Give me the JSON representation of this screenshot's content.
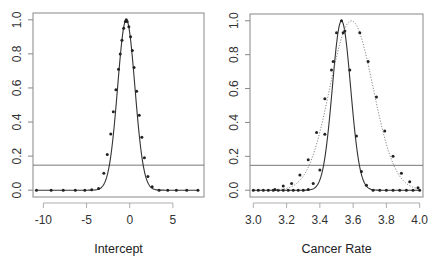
{
  "figure": {
    "top_right_text": "",
    "panels": [
      {
        "id": "intercept",
        "xlabel": "Intercept"
      },
      {
        "id": "cancer-rate",
        "xlabel": "Cancer Rate"
      }
    ]
  },
  "chart_data": [
    {
      "type": "line",
      "title": "",
      "xlabel": "Intercept",
      "ylabel": "",
      "xlim": [
        -11.2,
        8.6
      ],
      "ylim": [
        -0.04,
        1.04
      ],
      "xticks": [
        -10,
        -5,
        0,
        5
      ],
      "xtick_labels": [
        "-10",
        "-5",
        "0",
        "5"
      ],
      "yticks": [
        0.0,
        0.2,
        0.4,
        0.6,
        0.8,
        1.0
      ],
      "ytick_labels": [
        "0.0",
        "0.2",
        "0.4",
        "0.6",
        "0.8",
        "1.0"
      ],
      "grid": false,
      "legend": null,
      "hline": 0.147,
      "series": [
        {
          "name": "profile likelihood (solid, with points)",
          "style": "solid",
          "markers": true,
          "shape": "gaussian",
          "center": -0.4,
          "sd": 1.0,
          "x": [
            -10.8,
            -9.1,
            -7.7,
            -6.3,
            -5.2,
            -4.4,
            -3.6,
            -3.0,
            -2.6,
            -2.2,
            -1.9,
            -1.6,
            -1.3,
            -1.1,
            -0.9,
            -0.7,
            -0.5,
            -0.4,
            -0.3,
            -0.1,
            0.1,
            0.3,
            0.5,
            0.8,
            1.1,
            1.4,
            1.7,
            2.1,
            2.6,
            3.4,
            4.4,
            5.4,
            6.6,
            7.9
          ],
          "y": [
            0.0,
            0.0,
            0.0,
            0.0,
            0.0,
            0.002,
            0.01,
            0.1,
            0.21,
            0.33,
            0.46,
            0.59,
            0.71,
            0.8,
            0.88,
            0.95,
            0.99,
            1.0,
            0.99,
            0.96,
            0.9,
            0.82,
            0.72,
            0.58,
            0.44,
            0.31,
            0.19,
            0.08,
            0.02,
            0.0,
            0.0,
            0.0,
            0.0,
            0.0
          ]
        }
      ]
    },
    {
      "type": "line",
      "title": "",
      "xlabel": "Cancer Rate",
      "ylabel": "",
      "xlim": [
        2.98,
        4.02
      ],
      "ylim": [
        -0.04,
        1.04
      ],
      "xticks": [
        3.0,
        3.2,
        3.4,
        3.6,
        3.8,
        4.0
      ],
      "xtick_labels": [
        "3.0",
        "3.2",
        "3.4",
        "3.6",
        "3.8",
        "4.0"
      ],
      "yticks": [
        0.0,
        0.2,
        0.4,
        0.6,
        0.8,
        1.0
      ],
      "ytick_labels": [
        "0.0",
        "0.2",
        "0.4",
        "0.6",
        "0.8",
        "1.0"
      ],
      "grid": false,
      "legend": null,
      "hline": 0.147,
      "series": [
        {
          "name": "narrow profile (solid, with points)",
          "style": "solid",
          "markers": true,
          "shape": "gaussian",
          "center": 3.53,
          "sd": 0.055,
          "x": [
            3.0,
            3.03,
            3.06,
            3.09,
            3.12,
            3.15,
            3.18,
            3.21,
            3.24,
            3.27,
            3.3,
            3.33,
            3.36,
            3.4,
            3.43,
            3.47,
            3.5,
            3.53,
            3.55,
            3.58,
            3.62,
            3.65,
            3.68,
            3.72,
            3.76,
            3.8,
            3.84,
            3.88,
            3.92,
            3.96,
            4.0
          ],
          "y": [
            0.0,
            0.0,
            0.0,
            0.0,
            0.0,
            0.0,
            0.0,
            0.0,
            0.0,
            0.0,
            0.0,
            0.005,
            0.04,
            0.12,
            0.33,
            0.71,
            0.93,
            1.0,
            0.94,
            0.71,
            0.32,
            0.11,
            0.03,
            0.0,
            0.0,
            0.0,
            0.0,
            0.0,
            0.0,
            0.0,
            0.0
          ]
        },
        {
          "name": "wide profile (dotted, with points)",
          "style": "dotted",
          "markers": true,
          "shape": "gaussian",
          "center": 3.59,
          "sd": 0.13,
          "x": [
            3.13,
            3.18,
            3.23,
            3.28,
            3.33,
            3.38,
            3.43,
            3.48,
            3.54,
            3.64,
            3.69,
            3.74,
            3.79,
            3.84,
            3.89,
            3.94,
            3.99
          ],
          "y": [
            0.005,
            0.025,
            0.04,
            0.09,
            0.18,
            0.34,
            0.54,
            0.76,
            0.93,
            0.93,
            0.76,
            0.55,
            0.35,
            0.2,
            0.1,
            0.05,
            0.015
          ]
        }
      ]
    }
  ]
}
